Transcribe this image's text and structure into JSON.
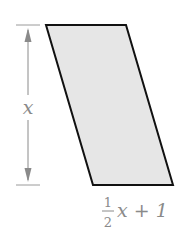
{
  "figure": {
    "shape": "parallelogram",
    "fill_color": "#e6e6e6",
    "stroke_color": "#111111",
    "dimension_color": "#8a8a8a",
    "height_label": "x",
    "base_label": {
      "numerator": "1",
      "denominator": "2",
      "rest": "x + 1"
    }
  }
}
